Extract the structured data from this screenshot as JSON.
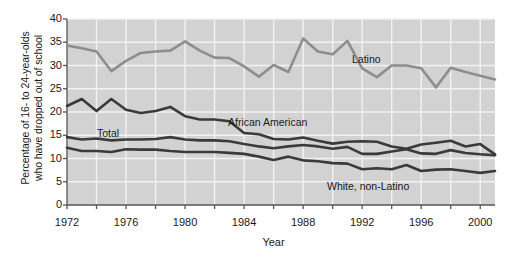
{
  "chart_data": {
    "type": "line",
    "title": "",
    "xlabel": "Year",
    "ylabel": "Percentage of 16- to 24-year-olds who have dropped out of school",
    "ylabel_line1": "Percentage of 16- to 24-year-olds",
    "ylabel_line2": "who have dropped out of school",
    "xlim": [
      1972,
      2001
    ],
    "ylim": [
      0,
      40
    ],
    "yticks": [
      0,
      5,
      10,
      15,
      20,
      25,
      30,
      35,
      40
    ],
    "xticks": [
      1972,
      1976,
      1980,
      1984,
      1988,
      1992,
      1996,
      2000
    ],
    "gridlines": "vertical every 2 years, horizontal at every y tick",
    "legend_position": "inline annotations on plot",
    "plot_bg": "#d2d2d2",
    "grid_color": "#f2f2f2",
    "x": [
      1972,
      1973,
      1974,
      1975,
      1976,
      1977,
      1978,
      1979,
      1980,
      1981,
      1982,
      1983,
      1984,
      1985,
      1986,
      1987,
      1988,
      1989,
      1990,
      1991,
      1992,
      1993,
      1994,
      1995,
      1996,
      1997,
      1998,
      1999,
      2000,
      2001
    ],
    "series": [
      {
        "name": "Latino",
        "color": "#8d8d8d",
        "label_x": 352,
        "label_y": 53,
        "values": [
          34.3,
          33.7,
          33.0,
          28.8,
          31.0,
          32.7,
          33.0,
          33.2,
          35.2,
          33.2,
          31.7,
          31.6,
          29.8,
          27.6,
          30.1,
          28.6,
          35.8,
          33.0,
          32.4,
          35.3,
          29.4,
          27.5,
          30.0,
          30.0,
          29.4,
          25.3,
          29.5,
          28.6,
          27.8,
          27.0
        ]
      },
      {
        "name": "African American",
        "color": "#3a3a3a",
        "label_x": 228,
        "label_y": 116,
        "values": [
          21.3,
          22.8,
          20.2,
          22.8,
          20.5,
          19.8,
          20.2,
          21.1,
          19.1,
          18.4,
          18.4,
          18.0,
          15.5,
          15.2,
          14.2,
          14.1,
          14.5,
          13.8,
          13.2,
          13.6,
          13.7,
          13.6,
          12.6,
          12.1,
          13.0,
          13.4,
          13.8,
          12.6,
          13.1,
          10.9
        ]
      },
      {
        "name": "Total",
        "color": "#3a3a3a",
        "label_x": 97,
        "label_y": 127,
        "values": [
          14.6,
          14.1,
          14.3,
          13.9,
          14.1,
          14.1,
          14.2,
          14.6,
          14.1,
          13.9,
          13.9,
          13.7,
          13.1,
          12.6,
          12.2,
          12.6,
          12.9,
          12.6,
          12.1,
          12.5,
          11.0,
          11.0,
          11.5,
          12.0,
          11.1,
          11.0,
          11.8,
          11.2,
          10.9,
          10.7
        ]
      },
      {
        "name": "White, non-Latino",
        "color": "#3a3a3a",
        "label_x": 327,
        "label_y": 180,
        "values": [
          12.3,
          11.6,
          11.6,
          11.4,
          12.0,
          11.9,
          11.9,
          11.6,
          11.4,
          11.4,
          11.4,
          11.2,
          11.0,
          10.4,
          9.7,
          10.4,
          9.6,
          9.4,
          9.0,
          8.9,
          7.7,
          7.9,
          7.7,
          8.6,
          7.3,
          7.6,
          7.7,
          7.3,
          6.9,
          7.3
        ]
      }
    ]
  }
}
